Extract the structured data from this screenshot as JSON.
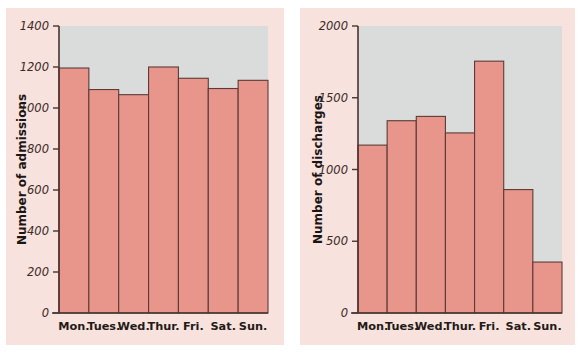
{
  "figure": {
    "background_color": "#ffffff",
    "panel_background_color": "#f7e2dd",
    "plot_background_color": "#d9dcdb",
    "bar_fill_color": "#e8958b",
    "bar_edge_color": "#5c3b36",
    "axis_color": "#4a3430"
  },
  "chart_data": [
    {
      "type": "bar",
      "title": "",
      "xlabel": "",
      "ylabel": "Number of admissions",
      "categories": [
        "Mon.",
        "Tues.",
        "Wed.",
        "Thur.",
        "Fri.",
        "Sat.",
        "Sun."
      ],
      "values": [
        1195,
        1090,
        1065,
        1200,
        1145,
        1095,
        1135
      ],
      "ylim": [
        0,
        1400
      ],
      "yticks": [
        0,
        200,
        400,
        600,
        800,
        1000,
        1200,
        1400
      ],
      "ytick_labels": [
        "0",
        "200",
        "400",
        "600",
        "800",
        "1000",
        "1200",
        "1400"
      ],
      "grid": false,
      "legend": "none"
    },
    {
      "type": "bar",
      "title": "",
      "xlabel": "",
      "ylabel": "Number of discharges",
      "categories": [
        "Mon.",
        "Tues.",
        "Wed.",
        "Thur.",
        "Fri.",
        "Sat.",
        "Sun."
      ],
      "values": [
        1170,
        1340,
        1370,
        1255,
        1755,
        860,
        355
      ],
      "ylim": [
        0,
        2000
      ],
      "yticks": [
        0,
        500,
        1000,
        1500,
        2000
      ],
      "ytick_labels": [
        "0",
        "500",
        "1000",
        "1500",
        "2000"
      ],
      "grid": false,
      "legend": "none"
    }
  ]
}
